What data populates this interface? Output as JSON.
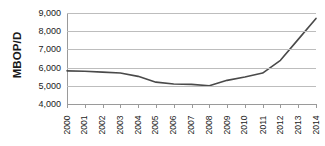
{
  "chart_data": {
    "type": "line",
    "title": "",
    "xlabel": "",
    "ylabel": "MBOP/D",
    "categories": [
      "2000",
      "2001",
      "2002",
      "2003",
      "2004",
      "2005",
      "2006",
      "2007",
      "2008",
      "2009",
      "2010",
      "2011",
      "2012",
      "2013",
      "2014"
    ],
    "values": [
      5820,
      5800,
      5750,
      5700,
      5520,
      5200,
      5100,
      5080,
      5000,
      5300,
      5480,
      5700,
      6400,
      7550,
      8700
    ],
    "series": [
      {
        "name": "MBOP/D",
        "values": [
          5820,
          5800,
          5750,
          5700,
          5520,
          5200,
          5100,
          5080,
          5000,
          5300,
          5480,
          5700,
          6400,
          7550,
          8700
        ]
      }
    ],
    "ylim": [
      4000,
      9000
    ],
    "y_ticks": [
      4000,
      5000,
      6000,
      7000,
      8000,
      9000
    ],
    "y_tick_labels": [
      "4,000",
      "5,000",
      "6,000",
      "7,000",
      "8,000",
      "9,000"
    ],
    "grid": true,
    "legend": "none",
    "line_color": "#4a4a4a",
    "gridline_color": "#bdbdbd",
    "axis_color": "#9a9a9a",
    "background_color": "#ffffff"
  }
}
